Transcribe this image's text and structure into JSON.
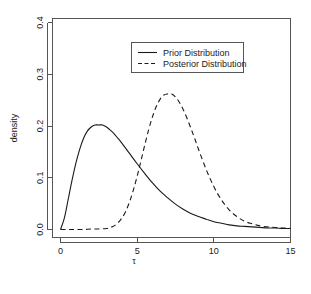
{
  "chart_data": {
    "type": "line",
    "title": "",
    "xlabel": "τ",
    "ylabel": "density",
    "xlim": [
      0,
      15
    ],
    "ylim": [
      0.0,
      0.4
    ],
    "xticks": [
      0,
      5,
      10,
      15
    ],
    "xtick_labels": [
      "0",
      "5",
      "10",
      "15"
    ],
    "yticks": [
      0.0,
      0.1,
      0.2,
      0.3,
      0.4
    ],
    "ytick_labels": [
      "0.0",
      "0.1",
      "0.2",
      "0.3",
      "0.4"
    ],
    "grid": false,
    "legend_position": "top-center",
    "series": [
      {
        "name": "Prior Distribution",
        "style": "solid",
        "color": "#1a1a1a",
        "peak_x": 2.7,
        "peak_y": 0.202,
        "x": [
          0.0,
          0.25,
          0.5,
          0.75,
          1.0,
          1.25,
          1.5,
          1.75,
          2.0,
          2.25,
          2.5,
          2.75,
          3.0,
          3.25,
          3.5,
          3.75,
          4.0,
          4.5,
          5.0,
          5.5,
          6.0,
          6.5,
          7.0,
          7.5,
          8.0,
          8.5,
          9.0,
          9.5,
          10.0,
          10.5,
          11.0,
          11.5,
          12.0,
          12.5,
          13.0,
          13.5,
          14.0,
          14.5,
          15.0
        ],
        "y": [
          0.0,
          0.022,
          0.058,
          0.095,
          0.128,
          0.155,
          0.176,
          0.19,
          0.198,
          0.202,
          0.202,
          0.202,
          0.198,
          0.192,
          0.185,
          0.176,
          0.167,
          0.147,
          0.127,
          0.108,
          0.09,
          0.074,
          0.061,
          0.049,
          0.039,
          0.031,
          0.025,
          0.02,
          0.015,
          0.012,
          0.009,
          0.007,
          0.006,
          0.005,
          0.004,
          0.003,
          0.003,
          0.002,
          0.002
        ]
      },
      {
        "name": "Posterior Distribution",
        "style": "dashed",
        "color": "#1a1a1a",
        "peak_x": 7.1,
        "peak_y": 0.262,
        "x": [
          0.0,
          0.5,
          1.0,
          1.5,
          2.0,
          2.5,
          3.0,
          3.25,
          3.5,
          3.75,
          4.0,
          4.25,
          4.5,
          4.75,
          5.0,
          5.25,
          5.5,
          5.75,
          6.0,
          6.25,
          6.5,
          6.75,
          7.0,
          7.25,
          7.5,
          7.75,
          8.0,
          8.25,
          8.5,
          8.75,
          9.0,
          9.5,
          10.0,
          10.5,
          11.0,
          11.5,
          12.0,
          12.5,
          13.0,
          13.5,
          14.0,
          14.5,
          15.0
        ],
        "y": [
          0.0,
          0.0,
          0.0,
          0.0,
          0.001,
          0.001,
          0.002,
          0.004,
          0.007,
          0.013,
          0.022,
          0.035,
          0.053,
          0.076,
          0.103,
          0.133,
          0.164,
          0.193,
          0.218,
          0.238,
          0.252,
          0.26,
          0.262,
          0.262,
          0.256,
          0.246,
          0.232,
          0.215,
          0.196,
          0.176,
          0.155,
          0.116,
          0.083,
          0.057,
          0.038,
          0.025,
          0.016,
          0.011,
          0.007,
          0.005,
          0.004,
          0.003,
          0.002
        ]
      }
    ]
  },
  "legend": {
    "entries": [
      {
        "label": "Prior Distribution",
        "style": "solid"
      },
      {
        "label": "Posterior Distribution",
        "style": "dashed"
      }
    ]
  },
  "axes": {
    "x_title": "τ",
    "y_title": "density"
  }
}
